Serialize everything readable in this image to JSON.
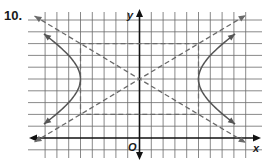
{
  "problem": {
    "number_label": "10."
  },
  "chart_data": {
    "type": "line",
    "title": "",
    "xlabel": "x",
    "ylabel": "y",
    "origin_label": "O",
    "grid": true,
    "grid_unit": 1,
    "xlim": [
      -8,
      9
    ],
    "ylim": [
      -1,
      10
    ],
    "hyperbola": {
      "orientation": "horizontal",
      "center": [
        0,
        5
      ],
      "a": 5,
      "b": 3,
      "vertices": [
        [
          -5,
          5
        ],
        [
          5,
          5
        ]
      ]
    },
    "central_rectangle": {
      "x": [
        -5,
        5
      ],
      "y": [
        2,
        8
      ],
      "style": "dashed"
    },
    "asymptotes": [
      {
        "equation": "y - 5 = (3/5)x",
        "style": "dashed"
      },
      {
        "equation": "y - 5 = -(3/5)x",
        "style": "dashed"
      }
    ]
  },
  "style": {
    "grid_color": "#6b6b6b",
    "axis_color": "#111111",
    "curve_color": "#555555",
    "dashed_color": "#6a6a6a"
  }
}
